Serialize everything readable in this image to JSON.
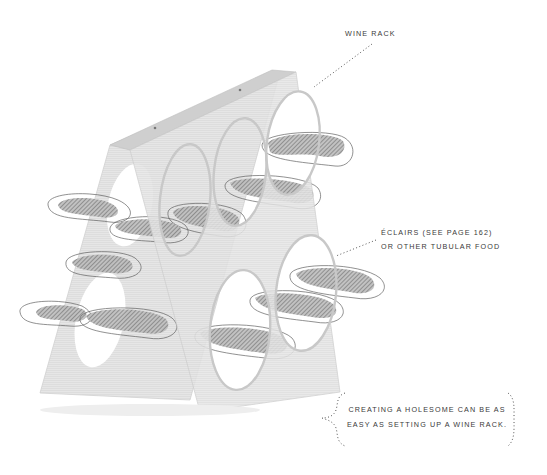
{
  "illustration": {
    "subject": "A-frame wine rack holding éclairs",
    "colors": {
      "background": "#ffffff",
      "rack_face": "#e4e4e4",
      "rack_edge": "#cfcfcf",
      "eclair_fill": "#8a8a8a",
      "outline": "#4a4a4a",
      "text": "#3a3a3a",
      "leader_dots": "#555555"
    }
  },
  "labels": {
    "wine_rack": "WINE RACK",
    "eclairs_line1": "ÉCLAIRS (SEE PAGE 162)",
    "eclairs_line2": "OR OTHER TUBULAR FOOD"
  },
  "callout": {
    "line1": "CREATING A HOLESOME CAN BE AS",
    "line2": "EASY AS SETTING UP A WINE RACK."
  }
}
